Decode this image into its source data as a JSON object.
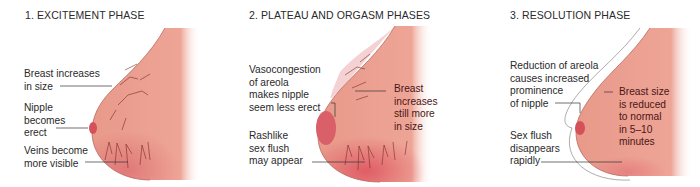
{
  "panels": [
    {
      "title": "1. EXCITEMENT PHASE",
      "labels": [
        "Breast increases\nin size",
        "Nipple\nbecomes\nerect",
        "Veins become\nmore visible"
      ]
    },
    {
      "title": "2. PLATEAU AND ORGASM PHASES",
      "labels": [
        "Vasocongestion\nof areola\nmakes nipple\nseem less erect",
        "Breast\nincreases\nstill more\nin size",
        "Rashlike\nsex flush\nmay appear"
      ]
    },
    {
      "title": "3. RESOLUTION PHASE",
      "labels": [
        "Reduction of areola\ncauses increased\nprominence\nof nipple",
        "Breast size\nis reduced\nto normal\nin 5–10\nminutes",
        "Sex flush\ndisappears\nrapidly"
      ]
    }
  ],
  "colors": {
    "skin": "#e8998a",
    "skin_light": "#f2b8a8",
    "flush": "#e0606e",
    "nipple": "#d6505a",
    "vein": "#7a2a2a",
    "leader": "#333333"
  }
}
